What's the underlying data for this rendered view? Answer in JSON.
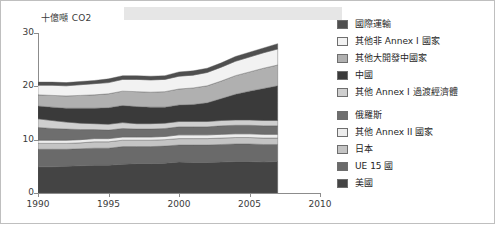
{
  "figure": {
    "banner_label": "",
    "axis": {
      "y_title": "十億噸 CO2",
      "y_ticks": [
        "0",
        "10",
        "20",
        "30"
      ],
      "x_ticks": [
        "1990",
        "1995",
        "2000",
        "2005",
        "2010"
      ]
    }
  },
  "legend": {
    "items": [
      {
        "label": "國際運輸",
        "color": "#4f4f4f",
        "name": "legend-item-international-transport"
      },
      {
        "label": "其他非 Annex I 國家",
        "color": "#f2f2f2",
        "name": "legend-item-other-non-annex-i"
      },
      {
        "label": "其他大開發中國家",
        "color": "#b0b0b0",
        "name": "legend-item-other-large-developing"
      },
      {
        "label": "中國",
        "color": "#3a3a3a",
        "name": "legend-item-china"
      },
      {
        "label": "其他 Annex I 過渡經濟體",
        "color": "#cfcfcf",
        "name": "legend-item-other-annex-i-transition"
      },
      {
        "label": "俄羅斯",
        "color": "#6e6e6e",
        "name": "legend-item-russia"
      },
      {
        "label": "其他 Annex II 國家",
        "color": "#ededed",
        "name": "legend-item-other-annex-ii"
      },
      {
        "label": "日本",
        "color": "#c4c4c4",
        "name": "legend-item-japan"
      },
      {
        "label": "UE 15 國",
        "color": "#6a6a6a",
        "name": "legend-item-eu-15"
      },
      {
        "label": "美國",
        "color": "#444444",
        "name": "legend-item-usa"
      }
    ]
  },
  "chart_data": {
    "type": "area",
    "title": "",
    "xlabel": "",
    "ylabel": "十億噸 CO2",
    "xlim": [
      1990,
      2010
    ],
    "ylim": [
      0,
      30
    ],
    "grid": false,
    "legend_position": "right",
    "stacked": true,
    "x": [
      1990,
      1991,
      1992,
      1993,
      1994,
      1995,
      1996,
      1997,
      1998,
      1999,
      2000,
      2001,
      2002,
      2003,
      2004,
      2005,
      2006,
      2007
    ],
    "series": [
      {
        "name": "美國",
        "color": "#444444",
        "values": [
          4.9,
          4.9,
          5.0,
          5.1,
          5.2,
          5.2,
          5.4,
          5.5,
          5.5,
          5.6,
          5.8,
          5.7,
          5.7,
          5.8,
          5.9,
          5.9,
          5.8,
          5.9
        ]
      },
      {
        "name": "UE 15 國",
        "color": "#6a6a6a",
        "values": [
          3.3,
          3.3,
          3.2,
          3.2,
          3.2,
          3.2,
          3.3,
          3.2,
          3.2,
          3.2,
          3.2,
          3.3,
          3.3,
          3.3,
          3.3,
          3.3,
          3.3,
          3.2
        ]
      },
      {
        "name": "日本",
        "color": "#c4c4c4",
        "values": [
          1.1,
          1.1,
          1.1,
          1.1,
          1.2,
          1.2,
          1.2,
          1.2,
          1.2,
          1.2,
          1.2,
          1.2,
          1.2,
          1.2,
          1.2,
          1.2,
          1.2,
          1.2
        ]
      },
      {
        "name": "其他 Annex II 國家",
        "color": "#ededed",
        "values": [
          0.6,
          0.6,
          0.6,
          0.6,
          0.6,
          0.6,
          0.6,
          0.6,
          0.6,
          0.6,
          0.7,
          0.7,
          0.7,
          0.7,
          0.7,
          0.7,
          0.7,
          0.7
        ]
      },
      {
        "name": "俄羅斯",
        "color": "#6e6e6e",
        "values": [
          2.4,
          2.2,
          2.1,
          1.9,
          1.7,
          1.6,
          1.6,
          1.5,
          1.5,
          1.5,
          1.5,
          1.5,
          1.5,
          1.6,
          1.6,
          1.6,
          1.6,
          1.6
        ]
      },
      {
        "name": "其他 Annex I 過渡經濟體",
        "color": "#cfcfcf",
        "values": [
          1.6,
          1.5,
          1.3,
          1.2,
          1.1,
          1.1,
          1.1,
          1.0,
          1.0,
          1.0,
          1.0,
          1.0,
          1.0,
          1.0,
          1.0,
          1.0,
          1.0,
          1.0
        ]
      },
      {
        "name": "中國",
        "color": "#3a3a3a",
        "values": [
          2.4,
          2.5,
          2.6,
          2.8,
          2.9,
          3.1,
          3.2,
          3.2,
          3.1,
          3.0,
          3.1,
          3.2,
          3.5,
          4.1,
          4.8,
          5.4,
          6.0,
          6.5
        ]
      },
      {
        "name": "其他大開發中國家",
        "color": "#b0b0b0",
        "values": [
          2.1,
          2.2,
          2.3,
          2.4,
          2.5,
          2.6,
          2.7,
          2.8,
          2.8,
          2.9,
          3.0,
          3.1,
          3.2,
          3.3,
          3.5,
          3.6,
          3.8,
          3.9
        ]
      },
      {
        "name": "其他非 Annex I 國家",
        "color": "#f2f2f2",
        "values": [
          1.8,
          1.9,
          1.9,
          2.0,
          2.1,
          2.1,
          2.2,
          2.3,
          2.3,
          2.3,
          2.4,
          2.4,
          2.5,
          2.6,
          2.7,
          2.8,
          2.9,
          3.0
        ]
      },
      {
        "name": "國際運輸",
        "color": "#4f4f4f",
        "values": [
          0.6,
          0.6,
          0.6,
          0.6,
          0.6,
          0.7,
          0.7,
          0.7,
          0.7,
          0.7,
          0.8,
          0.8,
          0.8,
          0.8,
          0.9,
          0.9,
          0.9,
          1.0
        ]
      }
    ]
  }
}
